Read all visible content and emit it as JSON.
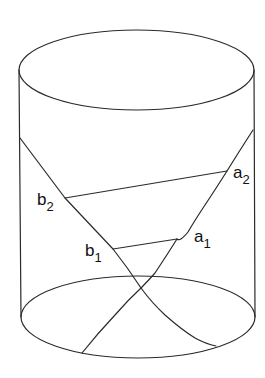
{
  "figure": {
    "stroke_color": "#2a2a2a",
    "background": "#ffffff",
    "labels": [
      {
        "id": "a1",
        "base": "a",
        "sub": "1"
      },
      {
        "id": "a2",
        "base": "a",
        "sub": "2"
      },
      {
        "id": "b1",
        "base": "b",
        "sub": "1"
      },
      {
        "id": "b2",
        "base": "b",
        "sub": "2"
      }
    ]
  }
}
